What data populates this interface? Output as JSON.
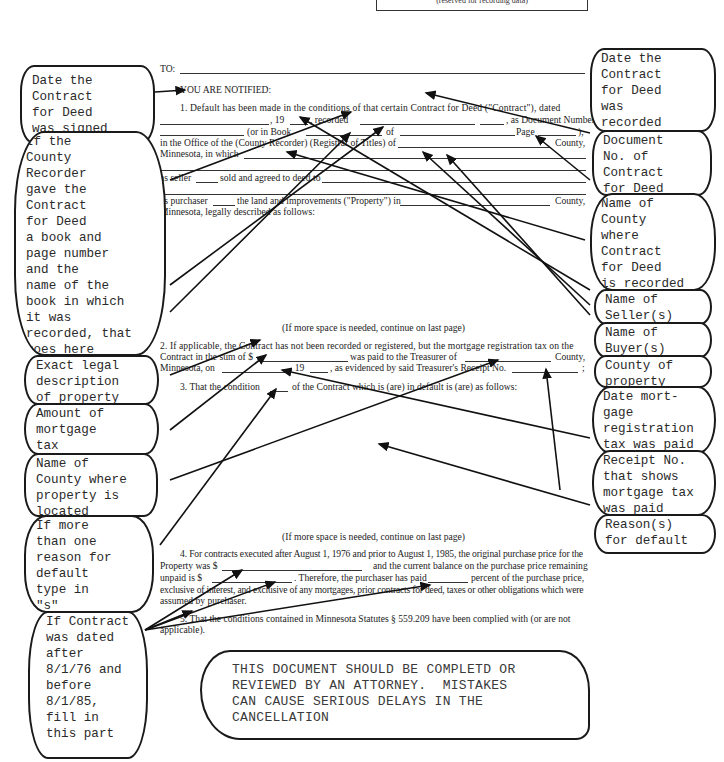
{
  "header": {
    "reserved_label": "(reserved for recording data)"
  },
  "form": {
    "to_label": "TO:",
    "notified": "YOU ARE NOTIFIED:",
    "p1": {
      "l1": "1.   Default has been made in the conditions of that certain Contract for Deed (\"Contract\"), dated",
      "l2a": ", 19",
      "l2b": ", recorded",
      "l2c": ", as Document Number",
      "l3a": "(or in Book",
      "l3b": "of",
      "l3c": "Page",
      "l3d": "),",
      "l4a": "in the Office of the (County Recorder) (Registrar of Titles) of",
      "l4b": "County,",
      "l5": "Minnesota, in which",
      "l7a": "as seller",
      "l7b": "sold and agreed to deed to",
      "l9a": "as purchaser",
      "l9b": "the land and improvements (\"Property\") in",
      "l9c": "County,",
      "l10": "Minnesota, legally described as follows:"
    },
    "more_space_1": "(If more space is needed, continue on last page)",
    "p2": {
      "l1": "2.   If applicable, the Contract has not been recorded or registered, but the mortgage registration tax on the",
      "l2a": "Contract in the sum of $",
      "l2b": "was paid to the Treasurer of",
      "l2c": "County,",
      "l3a": "Minnesota, on",
      "l3b": ", 19",
      "l3c": ", as evidenced by said Treasurer's Receipt No.",
      "l3d": ";"
    },
    "p3": {
      "a": "3.   That the condition",
      "b": "of the Contract which is (are) in default is (are) as follows:"
    },
    "more_space_2": "(If more space is needed, continue on last page)",
    "p4": {
      "l1": "4.   For contracts executed after August 1, 1976 and prior to August 1, 1985, the original purchase price for the",
      "l2a": "Property was $",
      "l2b": "and the current balance on the purchase price remaining",
      "l3a": "unpaid is $",
      "l3b": ". Therefore, the purchaser has paid",
      "l3c": "percent of the purchase price,",
      "l4": "exclusive of interest, and exclusive of any mortgages, prior contracts for deed, taxes or other obligations which were",
      "l5": "assumed by purchaser."
    },
    "p5": {
      "l1": "5.   That the conditions contained in Minnesota Statutes § 559.209 have been complied with (or are not",
      "l2": "applicable)."
    }
  },
  "callouts_left": [
    {
      "text": "Date the\nContract\nfor Deed\nwas signed"
    },
    {
      "text": "If the\nCounty\nRecorder\ngave the\nContract\nfor Deed\na book and\npage number\nand the\nname of the\nbook in which\nit was\nrecorded, that\ngoes here"
    },
    {
      "text": "Exact legal\ndescription\nof property"
    },
    {
      "text": "Amount of\nmortgage\ntax"
    },
    {
      "text": "Name of\nCounty where\nproperty is\nlocated"
    },
    {
      "text": "If more\nthan one\nreason for\ndefault\ntype in\n\"s\""
    },
    {
      "text": "If Contract\nwas dated\nafter\n8/1/76 and\nbefore\n8/1/85,\nfill in\nthis part"
    }
  ],
  "callouts_right": [
    {
      "text": "Date the\nContract\nfor Deed\nwas\nrecorded"
    },
    {
      "text": "Document\nNo. of\nContract\nfor Deed"
    },
    {
      "text": "Name of\nCounty\nwhere\nContract\nfor Deed\nis recorded"
    },
    {
      "text": "Name of\nSeller(s)"
    },
    {
      "text": "Name of\nBuyer(s)"
    },
    {
      "text": "County of\nproperty"
    },
    {
      "text": "Date mort-\ngage\nregistration\ntax was paid"
    },
    {
      "text": "Receipt No.\nthat shows\nmortgage tax\nwas paid"
    },
    {
      "text": "Reason(s)\nfor default"
    }
  ],
  "warning": {
    "text": "THIS DOCUMENT SHOULD BE COMPLETD OR\nREVIEWED BY AN ATTORNEY.  MISTAKES\nCAN CAUSE SERIOUS DELAYS IN THE\nCANCELLATION"
  }
}
